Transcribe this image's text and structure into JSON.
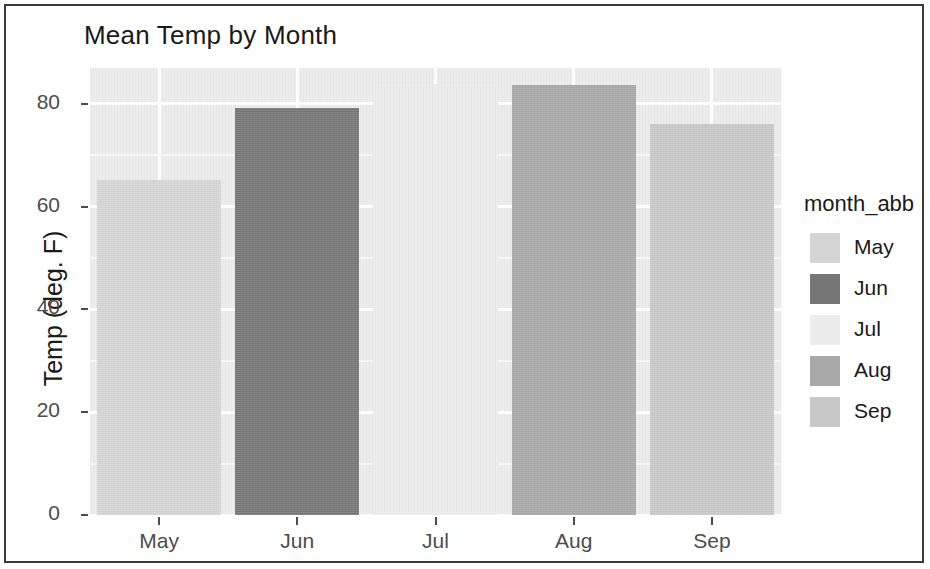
{
  "chart_data": {
    "type": "bar",
    "title": "Mean Temp by Month",
    "xlabel": "",
    "ylabel": "Temp (deg. F)",
    "categories": [
      "May",
      "Jun",
      "Jul",
      "Aug",
      "Sep"
    ],
    "values": [
      65.2,
      79.2,
      83.9,
      83.7,
      76.1
    ],
    "ylim": [
      0,
      87
    ],
    "yticks": [
      0,
      20,
      40,
      60,
      80
    ],
    "ytick_labels": [
      "0",
      "20",
      "40",
      "60",
      "80"
    ],
    "xtick_labels": [
      "May",
      "Jun",
      "Jul",
      "Aug",
      "Sep"
    ],
    "grid": true,
    "grid_color": "#ffffff",
    "panel_background": "#ebebeb",
    "legend": {
      "title": "month_abb",
      "position": "right",
      "entries": [
        {
          "label": "May",
          "color": "#d5d5d5"
        },
        {
          "label": "Jun",
          "color": "#767676"
        },
        {
          "label": "Jul",
          "color": "#ececec"
        },
        {
          "label": "Aug",
          "color": "#a8a8a8"
        },
        {
          "label": "Sep",
          "color": "#c8c8c8"
        }
      ]
    },
    "bar_colors": [
      "#d5d5d5",
      "#767676",
      "#ececec",
      "#a8a8a8",
      "#c8c8c8"
    ]
  }
}
